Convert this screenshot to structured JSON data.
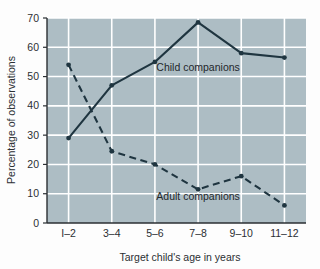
{
  "chart_data": {
    "type": "line",
    "title": "",
    "xlabel": "Target child's age in years",
    "ylabel": "Percentage of observations",
    "categories": [
      "I–2",
      "3–4",
      "5–6",
      "7–8",
      "9–10",
      "11–12"
    ],
    "ylim": [
      0,
      70
    ],
    "yticks": [
      0,
      10,
      20,
      30,
      40,
      50,
      60,
      70
    ],
    "ytick_labels": [
      "0",
      "10",
      "20",
      "30",
      "40",
      "50",
      "60",
      "70"
    ],
    "grid": true,
    "grid_color": "#ffffff",
    "plot_background": "#adbdc4",
    "legend_position": "inline-annotation",
    "series": [
      {
        "name": "Child companions",
        "style": "solid",
        "color": "#1f3540",
        "values": [
          29,
          47,
          55,
          68.5,
          58,
          56.5
        ]
      },
      {
        "name": "Adult companions",
        "style": "dashed",
        "color": "#1f3540",
        "values": [
          54,
          24.5,
          20,
          11.5,
          16,
          6
        ]
      }
    ],
    "annotations": [
      {
        "text": "Child companions",
        "x_category": "7–8",
        "y_value": 52
      },
      {
        "text": "Adult companions",
        "x_category": "7–8",
        "y_value": 8
      }
    ]
  }
}
